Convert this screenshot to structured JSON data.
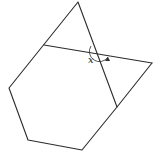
{
  "diagram": {
    "type": "geometry-figure",
    "angle_label": "x",
    "colors": {
      "stroke": "#2b2b2b",
      "background": "#ffffff"
    },
    "vertices": {
      "top": [
        78,
        2
      ],
      "left": [
        9,
        88
      ],
      "bottom_left": [
        28,
        140
      ],
      "bottom_right": [
        82,
        150
      ],
      "lower_right": [
        117,
        107
      ],
      "right": [
        152,
        63
      ],
      "transversal_start": [
        44,
        45
      ],
      "intersection": [
        97,
        54
      ]
    }
  }
}
